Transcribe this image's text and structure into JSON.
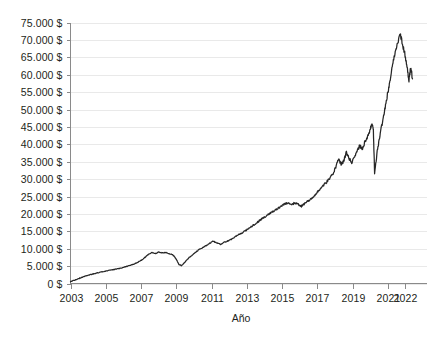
{
  "chart_data": {
    "type": "line",
    "title": "",
    "subtitle": "",
    "xlabel": "Año",
    "ylabel": "",
    "xlim": [
      2003,
      2022.4
    ],
    "ylim": [
      0,
      75000
    ],
    "grid": true,
    "legend": null,
    "legend_position": "none",
    "currency_suffix": "$",
    "thousands_separator": ".",
    "y_ticks": [
      0,
      5000,
      10000,
      15000,
      20000,
      25000,
      30000,
      35000,
      40000,
      45000,
      50000,
      55000,
      60000,
      65000,
      70000,
      75000
    ],
    "y_tick_labels": [
      "0 $",
      "5.000 $",
      "10.000 $",
      "15.000 $",
      "20.000 $",
      "25.000 $",
      "30.000 $",
      "35.000 $",
      "40.000 $",
      "45.000 $",
      "50.000 $",
      "55.000 $",
      "60.000 $",
      "65.000 $",
      "70.000 $",
      "75.000 $"
    ],
    "x_ticks": [
      2003,
      2005,
      2007,
      2009,
      2011,
      2013,
      2015,
      2017,
      2019,
      2021,
      2022
    ],
    "x_tick_labels": [
      "2003",
      "2005",
      "2007",
      "2009",
      "2011",
      "2013",
      "2015",
      "2017",
      "2019",
      "2021",
      "2022"
    ],
    "series": [
      {
        "name": "Valor acumulado",
        "color": "#262626",
        "x": [
          2003.0,
          2003.25,
          2003.5,
          2003.75,
          2004.0,
          2004.25,
          2004.5,
          2004.75,
          2005.0,
          2005.25,
          2005.5,
          2005.75,
          2006.0,
          2006.25,
          2006.5,
          2006.75,
          2007.0,
          2007.2,
          2007.4,
          2007.6,
          2007.8,
          2008.0,
          2008.2,
          2008.4,
          2008.6,
          2008.8,
          2009.0,
          2009.15,
          2009.3,
          2009.5,
          2009.7,
          2009.9,
          2010.1,
          2010.3,
          2010.5,
          2010.7,
          2010.9,
          2011.1,
          2011.3,
          2011.5,
          2011.7,
          2011.9,
          2012.1,
          2012.3,
          2012.5,
          2012.7,
          2012.9,
          2013.1,
          2013.3,
          2013.5,
          2013.7,
          2013.9,
          2014.1,
          2014.3,
          2014.5,
          2014.7,
          2014.9,
          2015.1,
          2015.3,
          2015.5,
          2015.7,
          2015.9,
          2016.1,
          2016.3,
          2016.5,
          2016.7,
          2016.9,
          2017.1,
          2017.3,
          2017.5,
          2017.7,
          2017.9,
          2018.05,
          2018.2,
          2018.35,
          2018.5,
          2018.65,
          2018.8,
          2018.95,
          2019.1,
          2019.25,
          2019.4,
          2019.55,
          2019.7,
          2019.85,
          2020.0,
          2020.1,
          2020.18,
          2020.25,
          2020.4,
          2020.55,
          2020.7,
          2020.85,
          2021.0,
          2021.12,
          2021.25,
          2021.4,
          2021.55,
          2021.7,
          2021.85,
          2022.0,
          2022.1,
          2022.2,
          2022.3,
          2022.4
        ],
        "y": [
          500,
          1000,
          1500,
          2000,
          2400,
          2700,
          3000,
          3300,
          3550,
          3800,
          4050,
          4300,
          4600,
          5000,
          5400,
          5900,
          6600,
          7400,
          8300,
          8900,
          8600,
          9000,
          8800,
          8900,
          8500,
          8300,
          7000,
          5500,
          5100,
          6200,
          7300,
          8200,
          9000,
          9800,
          10300,
          10900,
          11600,
          12100,
          11700,
          11200,
          11800,
          12200,
          12700,
          13300,
          13900,
          14400,
          15100,
          15800,
          16500,
          17200,
          18000,
          18800,
          19400,
          20100,
          20800,
          21400,
          22100,
          22700,
          23200,
          22600,
          23100,
          22800,
          22200,
          23000,
          23800,
          24600,
          25700,
          26800,
          27900,
          29000,
          30200,
          31600,
          33500,
          35800,
          34200,
          35200,
          37700,
          36000,
          34600,
          36200,
          38000,
          39600,
          38700,
          40600,
          42100,
          44300,
          45800,
          44000,
          31800,
          38000,
          42500,
          46500,
          50500,
          55000,
          58000,
          62500,
          66000,
          69000,
          71800,
          68500,
          65000,
          61500,
          58500,
          62000,
          58800
        ]
      }
    ],
    "annotations": []
  },
  "axes": {
    "x_axis_title": "Año",
    "y_axis_title": ""
  }
}
